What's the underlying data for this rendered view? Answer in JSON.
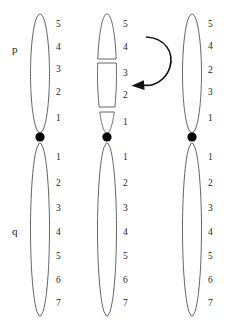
{
  "figure": {
    "type": "chromosome-ideogram-inversion-diagram",
    "title": "",
    "background_color": "#ffffff",
    "arm_labels": [
      {
        "id": "p-arm-label",
        "text": "p",
        "x": 12,
        "y": 44
      },
      {
        "id": "q-arm-label",
        "text": "q",
        "x": 12,
        "y": 226
      }
    ],
    "colors": {
      "band_dark": "#000000",
      "band_light": "#ffffff",
      "outline": "#555555",
      "band_separator": "#777777",
      "centromere": "#000000",
      "arrow": "#111111",
      "text": "#1d1d1d"
    },
    "centromere_y": 137,
    "chromosomes": [
      {
        "name": "normal-chromosome",
        "caption": "normal",
        "center_x": 40,
        "label_x": 56,
        "half_width": 9.5,
        "fragmented": false,
        "p_arm": {
          "top": 14,
          "bottom": 133,
          "bands": [
            {
              "label": "5",
              "stain": "light",
              "start": 14,
              "end": 36
            },
            {
              "label": "4",
              "stain": "dark",
              "start": 36,
              "end": 59
            },
            {
              "label": "3",
              "stain": "light",
              "start": 59,
              "end": 81
            },
            {
              "label": "2",
              "stain": "dark",
              "start": 81,
              "end": 104
            },
            {
              "label": "1",
              "stain": "light",
              "start": 104,
              "end": 133
            }
          ]
        },
        "q_arm": {
          "top": 143,
          "bottom": 316,
          "bands": [
            {
              "label": "1",
              "stain": "light",
              "start": 143,
              "end": 172
            },
            {
              "label": "2",
              "stain": "dark",
              "start": 172,
              "end": 196
            },
            {
              "label": "3",
              "stain": "light",
              "start": 196,
              "end": 221
            },
            {
              "label": "4",
              "stain": "dark",
              "start": 221,
              "end": 245
            },
            {
              "label": "5",
              "stain": "light",
              "start": 245,
              "end": 269
            },
            {
              "label": "6",
              "stain": "dark",
              "start": 269,
              "end": 292
            },
            {
              "label": "7",
              "stain": "light",
              "start": 292,
              "end": 316
            }
          ]
        }
      },
      {
        "name": "broken-chromosome",
        "caption": "broken into fragments",
        "center_x": 107,
        "label_x": 123,
        "half_width": 9.5,
        "fragmented": true,
        "p_arm": {
          "top": 14,
          "bottom": 133,
          "break_points": [
            59,
            104
          ],
          "bands": [
            {
              "label": "5",
              "stain": "light",
              "start": 14,
              "end": 36
            },
            {
              "label": "4",
              "stain": "dark",
              "start": 36,
              "end": 59
            },
            {
              "label": "3",
              "stain": "light",
              "start": 63,
              "end": 85
            },
            {
              "label": "2",
              "stain": "dark",
              "start": 85,
              "end": 107
            },
            {
              "label": "1",
              "stain": "light",
              "start": 112,
              "end": 133
            }
          ]
        },
        "q_arm": {
          "top": 143,
          "bottom": 316,
          "bands": [
            {
              "label": "1",
              "stain": "light",
              "start": 143,
              "end": 172
            },
            {
              "label": "2",
              "stain": "dark",
              "start": 172,
              "end": 196
            },
            {
              "label": "3",
              "stain": "light",
              "start": 196,
              "end": 221
            },
            {
              "label": "4",
              "stain": "dark",
              "start": 221,
              "end": 245
            },
            {
              "label": "5",
              "stain": "light",
              "start": 245,
              "end": 269
            },
            {
              "label": "6",
              "stain": "dark",
              "start": 269,
              "end": 292
            },
            {
              "label": "7",
              "stain": "light",
              "start": 292,
              "end": 316
            }
          ]
        }
      },
      {
        "name": "inverted-chromosome",
        "caption": "inverted segment reinserted",
        "center_x": 192,
        "label_x": 208,
        "half_width": 9.5,
        "fragmented": false,
        "p_arm": {
          "top": 14,
          "bottom": 133,
          "bands": [
            {
              "label": "5",
              "stain": "light",
              "start": 14,
              "end": 36
            },
            {
              "label": "4",
              "stain": "dark",
              "start": 36,
              "end": 58
            },
            {
              "label": "2",
              "stain": "dark",
              "start": 60,
              "end": 82
            },
            {
              "label": "3",
              "stain": "light",
              "start": 82,
              "end": 104
            },
            {
              "label": "1",
              "stain": "light",
              "start": 104,
              "end": 133
            }
          ]
        },
        "q_arm": {
          "top": 143,
          "bottom": 316,
          "bands": [
            {
              "label": "1",
              "stain": "light",
              "start": 143,
              "end": 172
            },
            {
              "label": "2",
              "stain": "dark",
              "start": 172,
              "end": 196
            },
            {
              "label": "3",
              "stain": "light",
              "start": 196,
              "end": 221
            },
            {
              "label": "4",
              "stain": "dark",
              "start": 221,
              "end": 245
            },
            {
              "label": "5",
              "stain": "light",
              "start": 245,
              "end": 269
            },
            {
              "label": "6",
              "stain": "dark",
              "start": 269,
              "end": 292
            },
            {
              "label": "7",
              "stain": "light",
              "start": 292,
              "end": 316
            }
          ]
        }
      }
    ],
    "arrow": {
      "name": "inversion-rotation-arrow",
      "direction": "counterclockwise",
      "tip_points": "left",
      "label": ""
    }
  }
}
